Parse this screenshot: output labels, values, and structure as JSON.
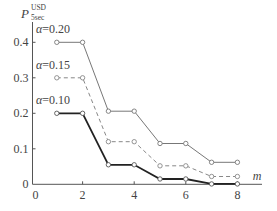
{
  "chart_data": {
    "type": "line",
    "title": "",
    "xlabel": "m",
    "ylabel": "P",
    "ylabel_superscript": "USD",
    "ylabel_subscript": "5sec",
    "x": [
      1,
      2,
      3,
      4,
      5,
      6,
      7,
      8
    ],
    "xlim": [
      0,
      8.8
    ],
    "ylim": [
      0,
      0.45
    ],
    "x_ticks": [
      0,
      2,
      4,
      6,
      8
    ],
    "x_tick_labels": [
      "0",
      "2",
      "4",
      "6",
      "8"
    ],
    "y_ticks": [
      0,
      0.1,
      0.2,
      0.3,
      0.4
    ],
    "y_tick_labels": [
      "0",
      "0.1",
      "0.2",
      "0.3",
      "0.4"
    ],
    "grid": false,
    "legend": "inline annotations",
    "series": [
      {
        "name": "α=0.20",
        "label": "α=0.20",
        "style": "solid-thin",
        "color": "#777777",
        "values": [
          0.4,
          0.4,
          0.206,
          0.206,
          0.115,
          0.115,
          0.062,
          0.062
        ]
      },
      {
        "name": "α=0.15",
        "label": "α=0.15",
        "style": "dashed",
        "color": "#888888",
        "values": [
          0.3,
          0.3,
          0.12,
          0.12,
          0.052,
          0.052,
          0.022,
          0.022
        ]
      },
      {
        "name": "α=0.10",
        "label": "α=0.10",
        "style": "solid-bold",
        "color": "#222222",
        "values": [
          0.2,
          0.2,
          0.055,
          0.055,
          0.015,
          0.015,
          0.001,
          0.001
        ]
      }
    ]
  }
}
